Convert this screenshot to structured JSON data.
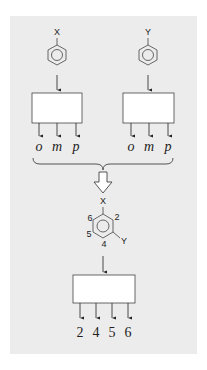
{
  "diagram": {
    "type": "substitution-flow",
    "colors": {
      "panel": "#ececec",
      "stroke": "#333333",
      "box_fill": "#ffffff"
    },
    "top_left": {
      "substituent": "X",
      "outputs": [
        "o",
        "m",
        "p"
      ]
    },
    "top_right": {
      "substituent": "Y",
      "outputs": [
        "o",
        "m",
        "p"
      ]
    },
    "merge_arrow": "hollow-down-arrow",
    "combined": {
      "substituent_top": "X",
      "substituent_side": "Y",
      "ring_positions": {
        "p6": "6",
        "p2": "2",
        "p5": "5",
        "p4": "4"
      }
    },
    "bottom_box": {
      "outputs": [
        "2",
        "4",
        "5",
        "6"
      ]
    }
  }
}
